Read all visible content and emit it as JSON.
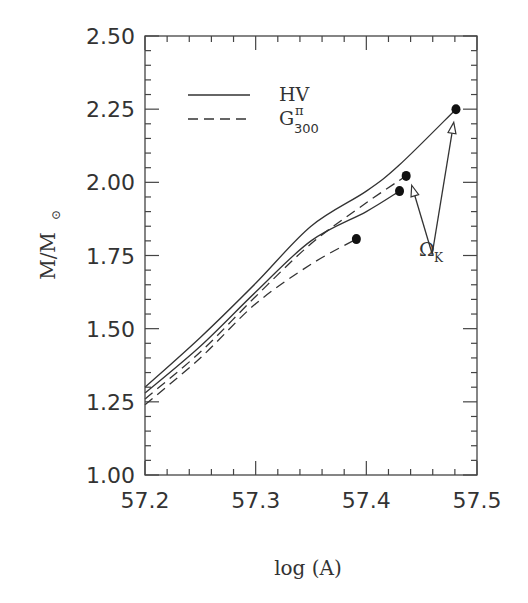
{
  "chart_data": {
    "type": "line",
    "title": "",
    "xlabel": "log (A)",
    "ylabel_main": "M/M",
    "ylabel_sub": "⊙",
    "xlim": [
      57.2,
      57.5
    ],
    "ylim": [
      1.0,
      2.5
    ],
    "x_ticks": [
      57.2,
      57.3,
      57.4,
      57.5
    ],
    "x_tick_labels": [
      "57.2",
      "57.3",
      "57.4",
      "57.5"
    ],
    "x_minor_step": 0.02,
    "y_ticks": [
      1.0,
      1.25,
      1.5,
      1.75,
      2.0,
      2.25,
      2.5
    ],
    "y_tick_labels": [
      "1.00",
      "1.25",
      "1.50",
      "1.75",
      "2.00",
      "2.25",
      "2.50"
    ],
    "y_minor_step": 0.05,
    "grid": false,
    "legend": {
      "placement": "top-left",
      "entries": [
        {
          "label": "HV",
          "style": "solid"
        },
        {
          "label_main": "G",
          "label_sup": "π",
          "label_sub": "300",
          "style": "dashed"
        }
      ]
    },
    "series": [
      {
        "name": "HV (upper)",
        "style": "solid",
        "x": [
          57.2,
          57.25,
          57.3,
          57.35,
          57.4,
          57.43,
          57.481
        ],
        "y": [
          1.3,
          1.47,
          1.655,
          1.85,
          1.97,
          2.06,
          2.25
        ],
        "endpoint_marker": true
      },
      {
        "name": "HV (lower)",
        "style": "solid",
        "x": [
          57.2,
          57.25,
          57.3,
          57.35,
          57.4,
          57.43
        ],
        "y": [
          1.28,
          1.44,
          1.625,
          1.8,
          1.9,
          1.97
        ],
        "endpoint_marker": true
      },
      {
        "name": "G300 (upper)",
        "style": "dashed",
        "x": [
          57.2,
          57.25,
          57.3,
          57.35,
          57.4,
          57.436
        ],
        "y": [
          1.26,
          1.42,
          1.61,
          1.79,
          1.93,
          2.022
        ],
        "endpoint_marker": true
      },
      {
        "name": "G300 (lower)",
        "style": "dashed",
        "x": [
          57.2,
          57.25,
          57.3,
          57.35,
          57.391
        ],
        "y": [
          1.24,
          1.4,
          1.585,
          1.72,
          1.806
        ],
        "endpoint_marker": true
      }
    ],
    "annotations": [
      {
        "text_main": "Ω",
        "text_sub": "K",
        "arrow_origin": [
          57.4595,
          1.755
        ],
        "arrow_targets": [
          [
            57.441,
            1.99
          ],
          [
            57.479,
            2.205
          ]
        ]
      }
    ]
  }
}
